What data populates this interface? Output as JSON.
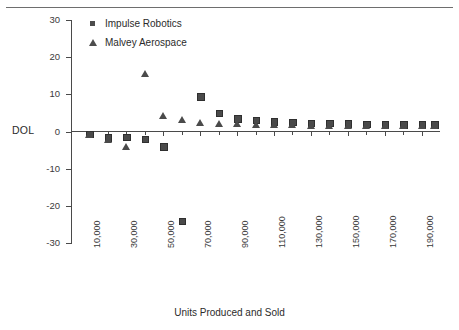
{
  "figure": {
    "has_top_rule": true,
    "background": "#ffffff",
    "marker_color": "#4a4a4a"
  },
  "axis": {
    "y_label": "DOL",
    "x_title": "Units Produced and Sold",
    "y_ticks": [
      "30",
      "20",
      "10",
      "0",
      "-10",
      "-20",
      "-30"
    ],
    "x_ticks": [
      "10,000",
      "30,000",
      "50,000",
      "70,000",
      "90,000",
      "110,000",
      "130,000",
      "150,000",
      "170,000",
      "190,000"
    ]
  },
  "legend": {
    "items": [
      {
        "label": "Impulse Robotics",
        "marker": "square-marker"
      },
      {
        "label": "Malvey Aerospace",
        "marker": "triangle-marker"
      }
    ]
  },
  "chart_data": {
    "type": "scatter",
    "title": "",
    "xlabel": "Units Produced and Sold",
    "ylabel": "DOL",
    "xlim": [
      0,
      200000
    ],
    "ylim": [
      -30,
      30
    ],
    "grid": false,
    "legend_position": "top-left-inside",
    "x_tick_values": [
      10000,
      30000,
      50000,
      70000,
      90000,
      110000,
      130000,
      150000,
      170000,
      190000
    ],
    "y_tick_values": [
      30,
      20,
      10,
      0,
      -10,
      -20,
      -30
    ],
    "series": [
      {
        "name": "Impulse Robotics",
        "marker": "square",
        "color": "#4a4a4a",
        "points": [
          {
            "x": 10000,
            "y": -0.6
          },
          {
            "x": 20000,
            "y": -1.5
          },
          {
            "x": 30000,
            "y": -1.4
          },
          {
            "x": 40000,
            "y": -2.0
          },
          {
            "x": 50000,
            "y": -4.0
          },
          {
            "x": 60000,
            "y": -24.0
          },
          {
            "x": 70000,
            "y": 9.5
          },
          {
            "x": 80000,
            "y": 5.0
          },
          {
            "x": 90000,
            "y": 3.6
          },
          {
            "x": 100000,
            "y": 3.1
          },
          {
            "x": 110000,
            "y": 2.8
          },
          {
            "x": 120000,
            "y": 2.6
          },
          {
            "x": 130000,
            "y": 2.4
          },
          {
            "x": 140000,
            "y": 2.3
          },
          {
            "x": 150000,
            "y": 2.2
          },
          {
            "x": 160000,
            "y": 2.1
          },
          {
            "x": 170000,
            "y": 2.0
          },
          {
            "x": 180000,
            "y": 2.0
          },
          {
            "x": 190000,
            "y": 1.9
          },
          {
            "x": 197000,
            "y": 1.9
          }
        ]
      },
      {
        "name": "Malvey Aerospace",
        "marker": "triangle",
        "color": "#4a4a4a",
        "points": [
          {
            "x": 10000,
            "y": -1.0
          },
          {
            "x": 20000,
            "y": -2.2
          },
          {
            "x": 30000,
            "y": -4.3
          },
          {
            "x": 40000,
            "y": 15.5
          },
          {
            "x": 50000,
            "y": 4.3
          },
          {
            "x": 60000,
            "y": 3.0
          },
          {
            "x": 70000,
            "y": 2.4
          },
          {
            "x": 80000,
            "y": 2.1
          },
          {
            "x": 90000,
            "y": 1.9
          },
          {
            "x": 100000,
            "y": 1.8
          },
          {
            "x": 110000,
            "y": 1.7
          },
          {
            "x": 120000,
            "y": 1.7
          },
          {
            "x": 130000,
            "y": 1.6
          },
          {
            "x": 140000,
            "y": 1.6
          },
          {
            "x": 150000,
            "y": 1.5
          },
          {
            "x": 160000,
            "y": 1.5
          },
          {
            "x": 170000,
            "y": 1.5
          },
          {
            "x": 180000,
            "y": 1.4
          },
          {
            "x": 190000,
            "y": 1.4
          },
          {
            "x": 197000,
            "y": 1.4
          }
        ]
      }
    ]
  }
}
